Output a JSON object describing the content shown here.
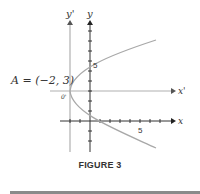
{
  "figure": {
    "caption": "FIGURE 3",
    "point_label": "A = (−2, 3)",
    "origin_prime_label": "0'",
    "axes": {
      "x": "x",
      "y": "y",
      "x_prime": "x'",
      "y_prime": "y'"
    },
    "tick_labels": {
      "x_five": "5",
      "y_five": "5"
    },
    "colors": {
      "axis": "#333333",
      "curve": "#a8a8a8",
      "shifted_axis": "#b0b0b0"
    }
  }
}
